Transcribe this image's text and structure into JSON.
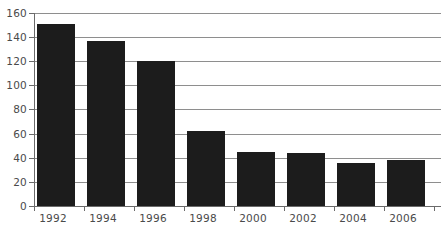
{
  "chart_data": {
    "type": "bar",
    "title": "",
    "subtitle": "",
    "xlabel": "",
    "ylabel": "",
    "categories": [
      "1992",
      "1994",
      "1996",
      "1998",
      "2000",
      "2002",
      "2004",
      "2006"
    ],
    "values": [
      151,
      137,
      120,
      62,
      45,
      44,
      36,
      38
    ],
    "series": [
      {
        "name": "",
        "values": [
          151,
          137,
          120,
          62,
          45,
          44,
          36,
          38
        ]
      }
    ],
    "ylim": [
      0,
      160
    ],
    "y_ticks": [
      0,
      20,
      40,
      60,
      80,
      100,
      120,
      140,
      160
    ],
    "y_tick_labels": [
      "0",
      "20",
      "40",
      "60",
      "80",
      "100",
      "120",
      "140",
      "160"
    ],
    "x_tick_labels": [
      "1992",
      "1994",
      "1996",
      "1998",
      "2000",
      "2002",
      "2004",
      "2006"
    ],
    "grid": true,
    "grid_axis": "y",
    "legend": false,
    "legend_position": "none",
    "bar_color": "#1c1c1c",
    "grid_color": "#8e8e8e",
    "axis_color": "#6b6b6b",
    "label_color": "#4a4a4a",
    "background_color": "#ffffff"
  }
}
